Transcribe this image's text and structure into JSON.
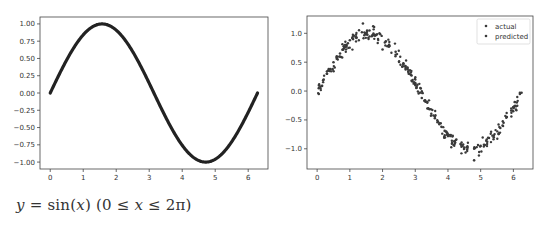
{
  "chart_data": [
    {
      "type": "line",
      "title": "",
      "xlabel": "",
      "ylabel": "",
      "function": "y = sin(x)",
      "x_range": [
        0,
        6.283
      ],
      "xlim": [
        -0.31,
        6.6
      ],
      "ylim": [
        -1.1,
        1.1
      ],
      "xticks": [
        0,
        1,
        2,
        3,
        4,
        5,
        6
      ],
      "xtick_labels": [
        "0",
        "1",
        "2",
        "3",
        "4",
        "5",
        "6"
      ],
      "yticks": [
        1.0,
        0.75,
        0.5,
        0.25,
        0.0,
        -0.25,
        -0.5,
        -0.75,
        -1.0
      ],
      "ytick_labels": [
        "1.00",
        "0.75",
        "0.50",
        "0.25",
        "0.00",
        "−0.25",
        "−0.50",
        "−0.75",
        "−1.00"
      ],
      "grid": false,
      "series": [
        {
          "name": "sin(x)",
          "color": "#222222",
          "x": [
            0,
            0.5,
            1.0,
            1.5708,
            2.0,
            2.5,
            3.0,
            3.1416,
            3.5,
            4.0,
            4.5,
            4.7124,
            5.0,
            5.5,
            6.0,
            6.2832
          ],
          "y": [
            0,
            0.479,
            0.841,
            1.0,
            0.909,
            0.598,
            0.141,
            0.0,
            -0.351,
            -0.757,
            -0.978,
            -1.0,
            -0.959,
            -0.706,
            -0.279,
            0.0
          ]
        }
      ]
    },
    {
      "type": "scatter",
      "title": "",
      "xlabel": "",
      "ylabel": "",
      "xlim": [
        -0.31,
        6.6
      ],
      "ylim": [
        -1.35,
        1.3
      ],
      "xticks": [
        0,
        1,
        2,
        3,
        4,
        5,
        6
      ],
      "xtick_labels": [
        "0",
        "1",
        "2",
        "3",
        "4",
        "5",
        "6"
      ],
      "yticks": [
        1.0,
        0.5,
        0.0,
        -0.5,
        -1.0
      ],
      "ytick_labels": [
        "1.0",
        "0.5",
        "0.0",
        "−0.5",
        "−1.0"
      ],
      "grid": false,
      "legend": {
        "position": "upper right",
        "entries": [
          "actual",
          "predicted"
        ]
      },
      "series": [
        {
          "name": "actual",
          "color": "#3a3a3a",
          "x": [
            0.05,
            0.1,
            0.2,
            0.3,
            0.4,
            0.5,
            0.6,
            0.7,
            0.8,
            1.0,
            1.1,
            1.2,
            1.4,
            1.5,
            1.6,
            1.8,
            2.0,
            2.2,
            2.4,
            2.6,
            2.8,
            3.0,
            3.2,
            3.4,
            3.6,
            3.8,
            4.0,
            4.2,
            4.4,
            4.6,
            4.8,
            5.0,
            5.2,
            5.4,
            5.6,
            5.8,
            6.0,
            6.2
          ],
          "y": [
            -0.05,
            0.08,
            0.2,
            0.3,
            0.38,
            0.5,
            0.6,
            0.65,
            0.72,
            0.88,
            0.9,
            0.92,
            1.17,
            0.98,
            1.05,
            0.97,
            0.72,
            0.8,
            0.63,
            0.42,
            0.3,
            0.12,
            -0.12,
            -0.3,
            -0.47,
            -0.62,
            -0.78,
            -0.87,
            -0.93,
            -0.98,
            -1.2,
            -0.95,
            -0.88,
            -0.8,
            -0.64,
            -0.45,
            -0.28,
            -0.05
          ]
        },
        {
          "name": "predicted",
          "color": "#3a3a3a",
          "x": [
            0.05,
            0.3,
            0.6,
            0.9,
            1.2,
            1.5,
            1.8,
            2.1,
            2.4,
            2.7,
            3.0,
            3.3,
            3.6,
            3.9,
            4.2,
            4.5,
            4.8,
            5.1,
            5.4,
            5.7,
            6.0,
            6.25
          ],
          "y": [
            0.05,
            0.3,
            0.56,
            0.78,
            0.93,
            1.0,
            0.97,
            0.86,
            0.68,
            0.43,
            0.14,
            -0.16,
            -0.44,
            -0.69,
            -0.87,
            -0.98,
            -1.0,
            -0.93,
            -0.77,
            -0.55,
            -0.28,
            -0.03
          ]
        }
      ]
    }
  ],
  "caption": {
    "lhs": "y",
    "eq": " = ",
    "fn": "sin",
    "arg_open": "(",
    "arg": "x",
    "arg_close": ")",
    "domain_open": " (0 ≤ ",
    "domain_var": "x",
    "domain_close": " ≤ 2π)"
  }
}
